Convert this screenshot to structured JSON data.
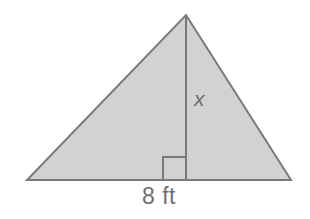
{
  "figure": {
    "kind": "geometry-diagram",
    "shape": "triangle",
    "background_color": "#ffffff",
    "fill_color": "#d2d2d2",
    "stroke_color": "#7a7a7a",
    "stroke_width": 2,
    "label_color": "#6e6e6e"
  },
  "labels": {
    "height_label": "x",
    "base_label": "8 ft"
  },
  "geometry": {
    "apex": {
      "x": 186,
      "y": 15
    },
    "bottom_left": {
      "x": 27,
      "y": 180
    },
    "bottom_right": {
      "x": 291,
      "y": 180
    },
    "altitude_foot": {
      "x": 186,
      "y": 180
    },
    "right_angle_marker": {
      "x": 163,
      "y": 157,
      "size": 23
    }
  },
  "measurements": {
    "base_value": "8",
    "base_unit": "ft",
    "height_value": "x"
  }
}
